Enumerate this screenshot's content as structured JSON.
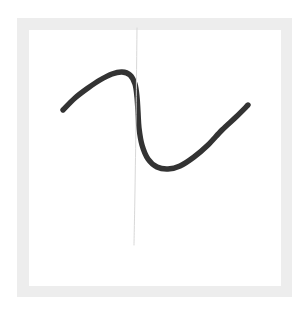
{
  "figure": {
    "background_color": "#ffffff",
    "frame_color": "#ededed",
    "canvas_color": "#ffffff"
  },
  "chart_data": {
    "type": "line",
    "title": "",
    "subtitle": "",
    "xlabel": "",
    "ylabel": "",
    "grid": false,
    "legend": [],
    "legend_position": "none",
    "annotations": [],
    "xticks": [],
    "yticks": [],
    "xlim": [
      0,
      100
    ],
    "ylim": [
      0,
      100
    ],
    "series": [
      {
        "name": "hand-drawn-curve",
        "style": "freehand-sketch",
        "color": "#333333",
        "stroke_width": 5.4,
        "shape": "cubic-s-curve",
        "points": [
          {
            "x": 63,
            "y": 110
          },
          {
            "x": 75,
            "y": 98
          },
          {
            "x": 88,
            "y": 88
          },
          {
            "x": 100,
            "y": 80
          },
          {
            "x": 112,
            "y": 74
          },
          {
            "x": 122,
            "y": 72
          },
          {
            "x": 130,
            "y": 75
          },
          {
            "x": 135,
            "y": 84
          },
          {
            "x": 137,
            "y": 97
          },
          {
            "x": 138,
            "y": 112
          },
          {
            "x": 139,
            "y": 128
          },
          {
            "x": 142,
            "y": 145
          },
          {
            "x": 148,
            "y": 159
          },
          {
            "x": 157,
            "y": 167
          },
          {
            "x": 168,
            "y": 169
          },
          {
            "x": 180,
            "y": 166
          },
          {
            "x": 194,
            "y": 157
          },
          {
            "x": 208,
            "y": 145
          },
          {
            "x": 222,
            "y": 130
          },
          {
            "x": 236,
            "y": 117
          },
          {
            "x": 248,
            "y": 105
          }
        ],
        "extrema": [
          {
            "kind": "local-maximum",
            "x": 122,
            "y": 72
          },
          {
            "kind": "local-minimum",
            "x": 168,
            "y": 169
          }
        ],
        "endpoints": [
          {
            "kind": "start",
            "x": 63,
            "y": 110
          },
          {
            "kind": "end",
            "x": 248,
            "y": 105
          }
        ]
      },
      {
        "name": "vertical-reference-line",
        "style": "thin-faint",
        "color": "#d8d8d8",
        "stroke_width": 1,
        "shape": "vertical-segment",
        "points": [
          {
            "x": 137,
            "y": 28
          },
          {
            "x": 136,
            "y": 120
          },
          {
            "x": 135,
            "y": 190
          },
          {
            "x": 134,
            "y": 245
          }
        ],
        "endpoints": [
          {
            "kind": "top",
            "x": 137,
            "y": 28
          },
          {
            "kind": "bottom",
            "x": 134,
            "y": 245
          }
        ]
      }
    ]
  }
}
